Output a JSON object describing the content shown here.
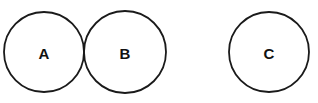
{
  "diagram": {
    "type": "circles",
    "stroke_color": "#1a1a1a",
    "background": "#ffffff",
    "circles": [
      {
        "id": "A",
        "label": "A",
        "cx": 44,
        "cy": 52,
        "r": 40
      },
      {
        "id": "B",
        "label": "B",
        "cx": 125,
        "cy": 52,
        "r": 41
      },
      {
        "id": "C",
        "label": "C",
        "cx": 269,
        "cy": 52,
        "r": 40
      }
    ],
    "relations": [
      {
        "from": "A",
        "to": "B",
        "relation": "tangent"
      }
    ]
  }
}
